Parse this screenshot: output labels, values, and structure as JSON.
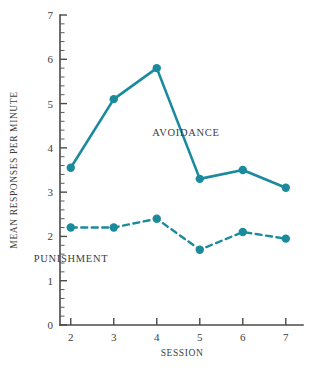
{
  "chart_data": {
    "type": "line",
    "title": "",
    "xlabel": "SESSION",
    "ylabel": "MEAN RESPONSES PER MINUTE",
    "x": [
      2,
      3,
      4,
      5,
      6,
      7
    ],
    "xlim": [
      1.75,
      7.4
    ],
    "ylim": [
      0,
      7
    ],
    "xticks": [
      "2",
      "3",
      "4",
      "5",
      "6",
      "7"
    ],
    "yticks": [
      "0",
      "1",
      "2",
      "3",
      "4",
      "5",
      "6",
      "7"
    ],
    "y_minor_per_major": 5,
    "grid": false,
    "legend": "inline-annotations",
    "series": [
      {
        "name": "AVOIDANCE",
        "style": "solid",
        "color": "#1a8a9c",
        "values": [
          3.55,
          5.1,
          5.8,
          3.3,
          3.5,
          3.1
        ]
      },
      {
        "name": "PUNISHMENT",
        "style": "dashed",
        "color": "#1a8a9c",
        "values": [
          2.2,
          2.2,
          2.4,
          1.7,
          2.1,
          1.95
        ]
      }
    ],
    "annotations": [
      {
        "text": "AVOIDANCE",
        "x_px": 186,
        "y_px": 136
      },
      {
        "text": "PUNISHMENT",
        "x_px": 71,
        "y_px": 262
      }
    ]
  }
}
